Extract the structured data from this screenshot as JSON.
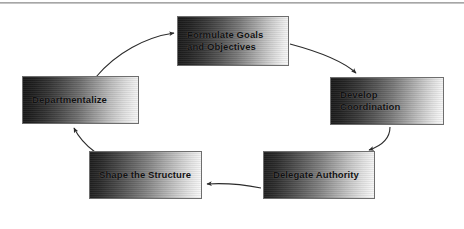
{
  "figure": {
    "type": "cycle-diagram",
    "orientation": "clockwise",
    "background_color": "#ffffff",
    "node_border_color": "#6e6e6e",
    "node_text_color": "#111111",
    "arrow_color": "#2b2b2b",
    "top_rule_color": "#9a9a9a"
  },
  "nodes": [
    {
      "id": "formulate",
      "label": "Formulate Goals\nand Objectives",
      "position": "top",
      "order": 1
    },
    {
      "id": "develop",
      "label": "Develop\nCoordination",
      "position": "right",
      "order": 2
    },
    {
      "id": "delegate",
      "label": "Delegate Authority",
      "position": "bottom-right",
      "order": 3
    },
    {
      "id": "shape",
      "label": "Shape the Structure",
      "position": "bottom-left",
      "order": 4
    },
    {
      "id": "departmentalize",
      "label": "Departmentalize",
      "position": "left",
      "order": 5
    }
  ],
  "connectors": [
    {
      "id": "arrow-formulate-to-develop",
      "from": "formulate",
      "to": "develop",
      "shape": "curved",
      "arrowhead": "filled"
    },
    {
      "id": "arrow-develop-to-delegate",
      "from": "develop",
      "to": "delegate",
      "shape": "curved",
      "arrowhead": "filled"
    },
    {
      "id": "arrow-delegate-to-shape",
      "from": "delegate",
      "to": "shape",
      "shape": "near-straight",
      "arrowhead": "filled"
    },
    {
      "id": "arrow-shape-to-departmentalize",
      "from": "shape",
      "to": "departmentalize",
      "shape": "curved",
      "arrowhead": "filled"
    },
    {
      "id": "arrow-departmentalize-to-formulate",
      "from": "departmentalize",
      "to": "formulate",
      "shape": "curved",
      "arrowhead": "filled"
    }
  ]
}
